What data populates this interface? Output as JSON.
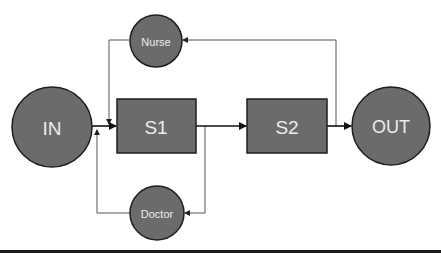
{
  "diagram": {
    "nodes": {
      "in": {
        "label": "IN",
        "shape": "circle"
      },
      "s1": {
        "label": "S1",
        "shape": "rectangle"
      },
      "s2": {
        "label": "S2",
        "shape": "rectangle"
      },
      "out": {
        "label": "OUT",
        "shape": "circle"
      },
      "nurse": {
        "label": "Nurse",
        "shape": "circle"
      },
      "doctor": {
        "label": "Doctor",
        "shape": "circle"
      }
    },
    "edges": [
      {
        "from": "IN",
        "to": "S1"
      },
      {
        "from": "S1",
        "to": "S2"
      },
      {
        "from": "S2",
        "to": "OUT"
      },
      {
        "from": "S2/OUT junction",
        "to": "Nurse"
      },
      {
        "from": "Nurse",
        "to": "S1 input"
      },
      {
        "from": "S1/S2 junction",
        "to": "Doctor"
      },
      {
        "from": "Doctor",
        "to": "S1 input"
      }
    ],
    "colors": {
      "node_fill": "#6b6b6b",
      "node_stroke": "#1e1e1e",
      "label": "#ececec",
      "feedback_line": "#555555",
      "main_line": "#111111"
    }
  }
}
